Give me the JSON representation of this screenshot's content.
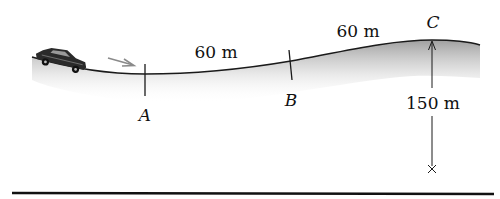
{
  "diagram": {
    "type": "physics-road-profile",
    "points": [
      {
        "id": "A",
        "label": "A"
      },
      {
        "id": "B",
        "label": "B"
      },
      {
        "id": "C",
        "label": "C"
      }
    ],
    "segments": [
      {
        "from": "A",
        "to": "B",
        "label": "60 m"
      },
      {
        "from": "B",
        "to": "C",
        "label": "60 m"
      }
    ],
    "height": {
      "at": "C",
      "label": "150 m"
    },
    "colors": {
      "road_line": "#1a1a1a",
      "shading": "#9a9a9a",
      "motion_arrow": "#8a8a8a",
      "ground": "#111111"
    },
    "icons": {
      "vehicle": "car-icon",
      "motion": "arrow-right-icon",
      "datum": "x-mark-icon"
    }
  }
}
